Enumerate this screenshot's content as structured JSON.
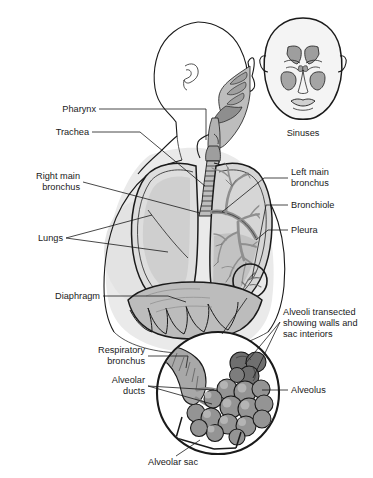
{
  "figure": {
    "background_color": "#ffffff",
    "line_color": "#1a1a1a"
  },
  "palette": {
    "skin_fill": "#f0f0f0",
    "body_shadow": "#e2e2e2",
    "airway_fill": "#b9b9b9",
    "airway_dark": "#8c8c8c",
    "lung_fill": "#d8d8d8",
    "lung_left_fill": "#c6c6c6",
    "bronchial_tree": "#9a9a9a",
    "diaphragm_fill": "#b0b0b0",
    "alveoli_fill": "#8f8f8f",
    "alveoli_dark": "#6e6e6e",
    "sinus_fill": "#9e9e9e",
    "outline": "#1a1a1a"
  },
  "labels": {
    "pharynx": "Pharynx",
    "trachea": "Trachea",
    "right_main_bronchus_line1": "Right main",
    "right_main_bronchus_line2": "bronchus",
    "lungs": "Lungs",
    "diaphragm": "Diaphragm",
    "sinuses": "Sinuses",
    "left_main_bronchus_line1": "Left main",
    "left_main_bronchus_line2": "bronchus",
    "bronchiole": "Bronchiole",
    "pleura": "Pleura",
    "alveoli_transected_line1": "Alveoli transected",
    "alveoli_transected_line2": "showing walls and",
    "alveoli_transected_line3": "sac interiors",
    "respiratory_bronchus_line1": "Respiratory",
    "respiratory_bronchus_line2": "bronchus",
    "alveolar_ducts_line1": "Alveolar",
    "alveolar_ducts_line2": "ducts",
    "alveolus": "Alveolus",
    "alveolar_sac": "Alveolar sac"
  },
  "structures": {
    "head_lateral": "lateral-head-with-airway",
    "head_frontal": "frontal-head-with-sinuses",
    "torso": "upper-torso-outline",
    "right_lung": "right-lung",
    "left_lung": "left-lung-with-bronchial-tree",
    "trachea": "trachea-cartilage-rings",
    "diaphragm": "diaphragm-dome",
    "inset_circle": "alveoli-magnification-inset",
    "callout_circle": "bronchiole-callout-circle"
  }
}
